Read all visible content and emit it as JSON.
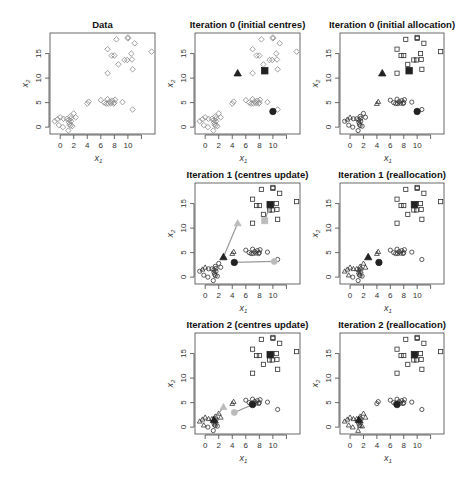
{
  "figure": {
    "width": 467,
    "height": 480,
    "colors": {
      "points": "#555555",
      "grey_points": "#888888",
      "centres": "#222222",
      "arrows": "#999999",
      "axis": "#444444"
    }
  },
  "chart_data": [
    {
      "type": "scatter",
      "id": "data",
      "title": "Data",
      "xlabel": "x1",
      "ylabel": "x2",
      "xticks": [
        0,
        2,
        4,
        6,
        8,
        10,
        12
      ],
      "xtick_labels": [
        "0",
        "2",
        "4",
        "6",
        "8",
        "10",
        ""
      ],
      "yticks": [
        0,
        5,
        10,
        15
      ],
      "ytick_labels": [
        "0",
        "5",
        "10",
        "15"
      ],
      "xlim": [
        -1.5,
        14
      ],
      "ylim": [
        -1.4,
        19.2
      ],
      "box": [
        50,
        33,
        155,
        134
      ],
      "series": [
        {
          "name": "observations",
          "marker": "diamond",
          "values": "all"
        }
      ]
    },
    {
      "type": "scatter",
      "id": "iter0-centres",
      "title": "Iteration 0 (initial centres)",
      "xlabel": "x1",
      "ylabel": "x2",
      "box": [
        195,
        33,
        300,
        134
      ],
      "centres": [
        {
          "cluster": 1,
          "marker": "triangle",
          "x": 4.8,
          "y": 11.0
        },
        {
          "cluster": 2,
          "marker": "square",
          "x": 8.8,
          "y": 11.5
        },
        {
          "cluster": 3,
          "marker": "circle",
          "x": 10.0,
          "y": 3.2
        }
      ]
    },
    {
      "type": "scatter",
      "id": "iter0-alloc",
      "title": "Iteration 0 (initial allocation)",
      "xlabel": "x1",
      "ylabel": "x2",
      "box": [
        340,
        33,
        444,
        134
      ],
      "centres": [
        {
          "cluster": 1,
          "marker": "triangle",
          "x": 4.8,
          "y": 11.0
        },
        {
          "cluster": 2,
          "marker": "square",
          "x": 8.8,
          "y": 11.5
        },
        {
          "cluster": 3,
          "marker": "circle",
          "x": 10.0,
          "y": 3.2
        }
      ]
    },
    {
      "type": "scatter",
      "id": "iter1-centres",
      "title": "Iteration 1 (centres update)",
      "xlabel": "x1",
      "ylabel": "x2",
      "box": [
        195,
        183,
        300,
        284
      ],
      "moves": [
        {
          "cluster": 1,
          "marker": "triangle",
          "from": [
            4.8,
            11.0
          ],
          "to": [
            2.7,
            4.1
          ]
        },
        {
          "cluster": 2,
          "marker": "square",
          "from": [
            8.8,
            11.5
          ],
          "to": [
            9.6,
            14.8
          ]
        },
        {
          "cluster": 3,
          "marker": "circle",
          "from": [
            10.2,
            3.2
          ],
          "to": [
            4.3,
            3.0
          ]
        }
      ]
    },
    {
      "type": "scatter",
      "id": "iter1-realloc",
      "title": "Iteration 1 (reallocation)",
      "xlabel": "x1",
      "ylabel": "x2",
      "box": [
        340,
        183,
        444,
        284
      ],
      "centres": [
        {
          "cluster": 1,
          "marker": "triangle",
          "x": 2.7,
          "y": 4.1
        },
        {
          "cluster": 2,
          "marker": "square",
          "x": 9.6,
          "y": 14.8
        },
        {
          "cluster": 3,
          "marker": "circle",
          "x": 4.3,
          "y": 3.0
        }
      ]
    },
    {
      "type": "scatter",
      "id": "iter2-centres",
      "title": "Iteration 2 (centres update)",
      "xlabel": "x1",
      "ylabel": "x2",
      "box": [
        195,
        333,
        300,
        434
      ],
      "moves": [
        {
          "cluster": 1,
          "marker": "triangle",
          "from": [
            2.7,
            4.1
          ],
          "to": [
            1.3,
            1.5
          ]
        },
        {
          "cluster": 2,
          "marker": "square",
          "from": [
            9.6,
            14.8
          ],
          "to": [
            9.6,
            14.8
          ]
        },
        {
          "cluster": 3,
          "marker": "circle",
          "from": [
            4.3,
            3.0
          ],
          "to": [
            7.0,
            4.6
          ]
        }
      ]
    },
    {
      "type": "scatter",
      "id": "iter2-realloc",
      "title": "Iteration 2 (reallocation)",
      "xlabel": "x1",
      "ylabel": "x2",
      "box": [
        340,
        333,
        444,
        434
      ],
      "centres": [
        {
          "cluster": 1,
          "marker": "triangle",
          "x": 1.3,
          "y": 1.5
        },
        {
          "cluster": 2,
          "marker": "square",
          "x": 9.6,
          "y": 14.8
        },
        {
          "cluster": 3,
          "marker": "circle",
          "x": 7.0,
          "y": 4.6
        }
      ]
    }
  ],
  "points": [
    [
      -0.8,
      1.2
    ],
    [
      -0.4,
      1.6
    ],
    [
      0.0,
      2.0
    ],
    [
      0.5,
      1.7
    ],
    [
      -0.2,
      0.4
    ],
    [
      0.4,
      0.0
    ],
    [
      1.0,
      1.7
    ],
    [
      1.3,
      1.5
    ],
    [
      1.3,
      1.0
    ],
    [
      1.4,
      0.6
    ],
    [
      1.5,
      0.3
    ],
    [
      1.5,
      2.2
    ],
    [
      1.6,
      1.2
    ],
    [
      1.2,
      -0.7
    ],
    [
      1.8,
      0.2
    ],
    [
      2.0,
      2.8
    ],
    [
      2.3,
      2.0
    ],
    [
      1.6,
      1.8
    ],
    [
      4.0,
      4.8
    ],
    [
      4.2,
      5.2
    ],
    [
      6.0,
      5.5
    ],
    [
      6.5,
      5.0
    ],
    [
      6.8,
      4.8
    ],
    [
      7.0,
      5.7
    ],
    [
      7.1,
      4.8
    ],
    [
      7.3,
      5.2
    ],
    [
      7.5,
      4.9
    ],
    [
      7.7,
      5.4
    ],
    [
      8.0,
      5.0
    ],
    [
      8.1,
      5.6
    ],
    [
      7.9,
      4.8
    ],
    [
      9.2,
      5.1
    ],
    [
      10.7,
      3.6
    ],
    [
      7.0,
      11.0
    ],
    [
      7.0,
      15.9
    ],
    [
      7.6,
      14.6
    ],
    [
      8.0,
      14.6
    ],
    [
      8.3,
      17.9
    ],
    [
      8.6,
      12.8
    ],
    [
      9.5,
      13.7
    ],
    [
      9.9,
      13.7
    ],
    [
      10.0,
      18.3
    ],
    [
      10.0,
      18.1
    ],
    [
      10.5,
      15.0
    ],
    [
      10.6,
      13.8
    ],
    [
      10.7,
      11.8
    ],
    [
      11.0,
      17.1
    ],
    [
      13.5,
      15.4
    ]
  ],
  "allocations": {
    "iter0-alloc": [
      3,
      1,
      1,
      3,
      3,
      3,
      3,
      3,
      3,
      3,
      3,
      3,
      3,
      3,
      3,
      3,
      3,
      3,
      1,
      1,
      3,
      3,
      3,
      3,
      3,
      3,
      3,
      3,
      3,
      3,
      3,
      3,
      3,
      2,
      2,
      2,
      2,
      2,
      2,
      2,
      2,
      2,
      2,
      2,
      2,
      2,
      2,
      2
    ],
    "iter1-centres": [
      3,
      1,
      1,
      3,
      3,
      3,
      3,
      3,
      3,
      3,
      3,
      3,
      3,
      3,
      3,
      3,
      3,
      3,
      1,
      1,
      3,
      3,
      3,
      3,
      3,
      3,
      3,
      3,
      3,
      3,
      3,
      3,
      3,
      2,
      2,
      2,
      2,
      2,
      2,
      2,
      2,
      2,
      2,
      2,
      2,
      2,
      2,
      2
    ],
    "iter1-realloc": [
      1,
      1,
      1,
      1,
      1,
      3,
      1,
      1,
      1,
      1,
      3,
      1,
      1,
      3,
      3,
      1,
      1,
      1,
      1,
      1,
      3,
      3,
      3,
      3,
      3,
      3,
      3,
      3,
      3,
      3,
      3,
      3,
      3,
      2,
      2,
      2,
      2,
      2,
      2,
      2,
      2,
      2,
      2,
      2,
      2,
      2,
      2,
      2
    ],
    "iter2-centres": [
      1,
      1,
      1,
      1,
      1,
      3,
      1,
      1,
      1,
      1,
      3,
      1,
      1,
      3,
      3,
      1,
      1,
      1,
      1,
      1,
      3,
      3,
      3,
      3,
      3,
      3,
      3,
      3,
      3,
      3,
      3,
      3,
      3,
      2,
      2,
      2,
      2,
      2,
      2,
      2,
      2,
      2,
      2,
      2,
      2,
      2,
      2,
      2
    ],
    "iter2-realloc": [
      1,
      1,
      1,
      1,
      1,
      1,
      1,
      1,
      1,
      1,
      1,
      1,
      1,
      1,
      1,
      1,
      1,
      1,
      3,
      3,
      3,
      3,
      3,
      3,
      3,
      3,
      3,
      3,
      3,
      3,
      3,
      3,
      3,
      2,
      2,
      2,
      2,
      2,
      2,
      2,
      2,
      2,
      2,
      2,
      2,
      2,
      2,
      2
    ]
  }
}
